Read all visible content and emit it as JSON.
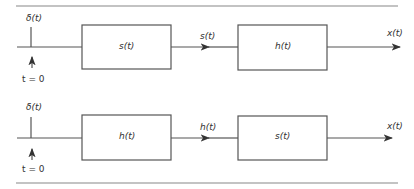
{
  "diagrams": [
    {
      "input_label": "δ(t)",
      "time_label": "t = 0",
      "block1": "s(t)",
      "intermediate": "s(t)",
      "block2": "h(t)",
      "output": "x(t)"
    },
    {
      "input_label": "δ(t)",
      "time_label": "t = 0",
      "block1": "h(t)",
      "intermediate": "h(t)",
      "block2": "s(t)",
      "output": "x(t)"
    }
  ],
  "colors": {
    "line": "#444444",
    "background": "#ffffff"
  }
}
